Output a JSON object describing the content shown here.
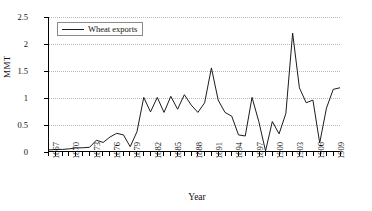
{
  "chart_data": {
    "type": "line",
    "title": "",
    "xlabel": "Year",
    "ylabel": "MMT",
    "xlim": [
      1867,
      1910
    ],
    "ylim": [
      0,
      2.5
    ],
    "yticks": [
      0,
      0.5,
      1,
      1.5,
      2,
      2.5
    ],
    "ytick_labels": [
      "0",
      "0.5",
      "1",
      "1.5",
      "2",
      "2.5"
    ],
    "xticks": [
      1867,
      1870,
      1873,
      1876,
      1879,
      1882,
      1885,
      1888,
      1891,
      1894,
      1897,
      1900,
      1903,
      1906,
      1909
    ],
    "xtick_labels": [
      "1867",
      "1870",
      "1873",
      "1876",
      "1879",
      "1882",
      "1885",
      "1888",
      "1891",
      "1894",
      "1897",
      "1900",
      "1903",
      "1906",
      "1909"
    ],
    "xtick_rotation": -90,
    "grid": "horizontal-dotted",
    "legend_position": "top-left",
    "legend": [
      "Wheat exports"
    ],
    "series": [
      {
        "name": "Wheat exports",
        "color": "#1a1a1a",
        "x": [
          1867,
          1868,
          1869,
          1870,
          1871,
          1872,
          1873,
          1874,
          1875,
          1876,
          1877,
          1878,
          1879,
          1880,
          1881,
          1882,
          1883,
          1884,
          1885,
          1886,
          1887,
          1888,
          1889,
          1890,
          1891,
          1892,
          1893,
          1894,
          1895,
          1896,
          1897,
          1898,
          1899,
          1900,
          1901,
          1902,
          1903,
          1904,
          1905,
          1906,
          1907,
          1908,
          1909,
          1910
        ],
        "values": [
          0.02,
          0.03,
          0.03,
          0.04,
          0.06,
          0.06,
          0.07,
          0.2,
          0.16,
          0.26,
          0.33,
          0.3,
          0.08,
          0.36,
          1.0,
          0.73,
          1.0,
          0.72,
          1.02,
          0.78,
          1.05,
          0.86,
          0.72,
          0.9,
          1.55,
          0.95,
          0.72,
          0.65,
          0.3,
          0.28,
          1.0,
          0.55,
          0.0,
          0.55,
          0.32,
          0.7,
          2.2,
          1.18,
          0.9,
          0.95,
          0.15,
          0.8,
          1.15,
          1.18
        ]
      }
    ]
  }
}
